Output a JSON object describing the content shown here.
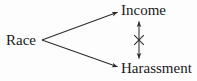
{
  "diagram": {
    "type": "causal-path-diagram",
    "background_color": "#fdfdfd",
    "line_color": "#2b2b2b",
    "nodes": [
      {
        "id": "race",
        "label": "Race",
        "x": 21,
        "y": 40
      },
      {
        "id": "income",
        "label": "Income",
        "x": 148,
        "y": 11
      },
      {
        "id": "harassment",
        "label": "Harassment",
        "x": 157,
        "y": 68
      }
    ],
    "edges": [
      {
        "id": "race-to-income",
        "from": "race",
        "to": "income",
        "style": "single-headed-arrow",
        "blocked": false
      },
      {
        "id": "race-to-harassment",
        "from": "race",
        "to": "harassment",
        "style": "single-headed-arrow",
        "blocked": false
      },
      {
        "id": "income-harassment",
        "from": "income",
        "to": "harassment",
        "style": "double-headed-arrow",
        "blocked": true,
        "blocked_marker": "x-cross"
      }
    ],
    "markers": {
      "cross_label": "X",
      "cross_meaning": "blocked-path"
    }
  }
}
